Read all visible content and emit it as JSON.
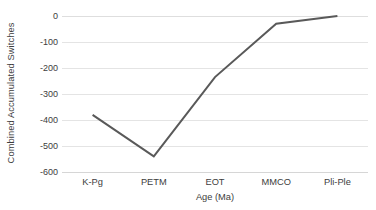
{
  "chart_data": {
    "type": "line",
    "title": "",
    "xlabel": "Age (Ma)",
    "ylabel": "Combined Accumulated Switches",
    "categories": [
      "K-Pg",
      "PETM",
      "EOT",
      "MMCO",
      "Pli-Ple"
    ],
    "values": [
      -380,
      -540,
      -235,
      -30,
      0
    ],
    "series": [
      {
        "name": "Combined Accumulated Switches",
        "values": [
          -380,
          -540,
          -235,
          -30,
          0
        ],
        "color": "#595959"
      }
    ],
    "ylim": [
      -600,
      0
    ],
    "ytick_labels": [
      "0",
      "-100",
      "-200",
      "-300",
      "-400",
      "-500",
      "-600"
    ],
    "ytick_values": [
      0,
      -100,
      -200,
      -300,
      -400,
      -500,
      -600
    ],
    "grid": true,
    "grid_orientation": "horizontal",
    "legend": false,
    "legend_position": "none",
    "markers": false,
    "background_color": "#ffffff",
    "gridline_color": "#e4e4e4",
    "line_color": "#595959",
    "line_width": 2
  }
}
